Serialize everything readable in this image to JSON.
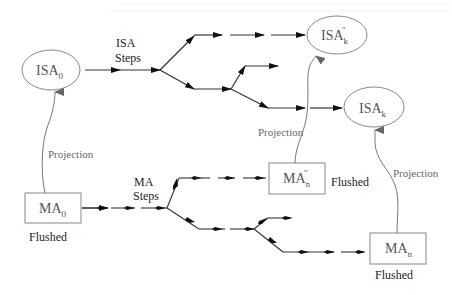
{
  "diagram": {
    "type": "state-transition-diagram",
    "nodes": {
      "isa0": {
        "base": "ISA",
        "sub": "0",
        "sup": "",
        "shape": "ellipse"
      },
      "isak_pp": {
        "base": "ISA",
        "sub": "k",
        "sup": "''",
        "shape": "ellipse"
      },
      "isak": {
        "base": "ISA",
        "sub": "k",
        "sup": "",
        "shape": "ellipse"
      },
      "ma0": {
        "base": "MA",
        "sub": "0",
        "sup": "",
        "shape": "rect",
        "status": "Flushed"
      },
      "man_pp": {
        "base": "MA",
        "sub": "n",
        "sup": "''",
        "shape": "rect",
        "status": "Flushed"
      },
      "man": {
        "base": "MA",
        "sub": "n",
        "sup": "",
        "shape": "rect",
        "status": "Flushed"
      }
    },
    "labels": {
      "isa_steps_1": "ISA",
      "isa_steps_2": "Steps",
      "ma_steps_1": "MA",
      "ma_steps_2": "Steps",
      "projection": "Projection",
      "flushed": "Flushed"
    },
    "edges": [
      {
        "from": "ma0",
        "to": "isa0",
        "label": "Projection"
      },
      {
        "from": "man_pp",
        "to": "isak_pp",
        "label": "Projection"
      },
      {
        "from": "man",
        "to": "isak",
        "label": "Projection"
      },
      {
        "from": "isa0",
        "to": "isak_pp",
        "label": "ISA Steps"
      },
      {
        "from": "isa0",
        "to": "isak",
        "label": "ISA Steps"
      },
      {
        "from": "ma0",
        "to": "man_pp",
        "label": "MA Steps"
      },
      {
        "from": "ma0",
        "to": "man",
        "label": "MA Steps"
      }
    ],
    "colors": {
      "line": "#333333",
      "projection_line": "#777777",
      "node_border": "#888888",
      "text": "#222222"
    }
  }
}
